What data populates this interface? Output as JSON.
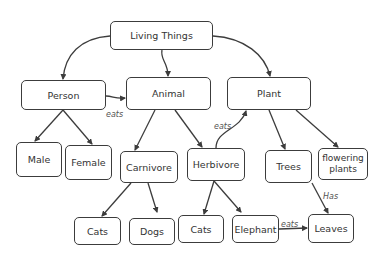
{
  "diagram": {
    "type": "concept-map",
    "nodes": [
      {
        "id": "living",
        "label": "Living Things",
        "x": 110,
        "y": 21,
        "w": 103,
        "h": 29
      },
      {
        "id": "person",
        "label": "Person",
        "x": 21,
        "y": 80,
        "w": 85,
        "h": 30
      },
      {
        "id": "animal",
        "label": "Animal",
        "x": 126,
        "y": 77,
        "w": 85,
        "h": 33
      },
      {
        "id": "plant",
        "label": "Plant",
        "x": 227,
        "y": 77,
        "w": 84,
        "h": 33
      },
      {
        "id": "male",
        "label": "Male",
        "x": 16,
        "y": 142,
        "w": 46,
        "h": 35
      },
      {
        "id": "female",
        "label": "Female",
        "x": 65,
        "y": 145,
        "w": 47,
        "h": 35
      },
      {
        "id": "carnivore",
        "label": "Carnivore",
        "x": 120,
        "y": 151,
        "w": 58,
        "h": 32
      },
      {
        "id": "herbivore",
        "label": "Herbivore",
        "x": 187,
        "y": 148,
        "w": 58,
        "h": 33
      },
      {
        "id": "trees",
        "label": "Trees",
        "x": 265,
        "y": 150,
        "w": 47,
        "h": 33
      },
      {
        "id": "flowering",
        "label": "flowering plants",
        "x": 318,
        "y": 148,
        "w": 50,
        "h": 32
      },
      {
        "id": "cats1",
        "label": "Cats",
        "x": 74,
        "y": 217,
        "w": 47,
        "h": 28
      },
      {
        "id": "dogs",
        "label": "Dogs",
        "x": 129,
        "y": 218,
        "w": 46,
        "h": 27
      },
      {
        "id": "cats2",
        "label": "Cats",
        "x": 178,
        "y": 215,
        "w": 46,
        "h": 28
      },
      {
        "id": "elephant",
        "label": "Elephant",
        "x": 232,
        "y": 215,
        "w": 47,
        "h": 28
      },
      {
        "id": "leaves",
        "label": "Leaves",
        "x": 308,
        "y": 214,
        "w": 46,
        "h": 29
      }
    ],
    "edge_labels": [
      {
        "text": "eats",
        "x": 106,
        "y": 110
      },
      {
        "text": "eats",
        "x": 214,
        "y": 122
      },
      {
        "text": "Has",
        "x": 323,
        "y": 192
      },
      {
        "text": "eats",
        "x": 281,
        "y": 220
      }
    ],
    "line_color": "#3c3c3c"
  }
}
